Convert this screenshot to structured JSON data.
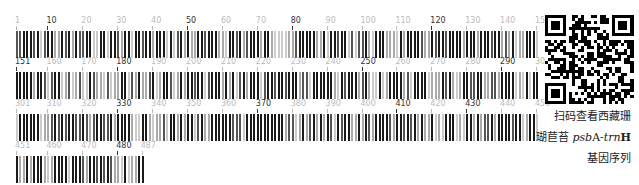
{
  "figure": {
    "rows": [
      {
        "start": 1,
        "end": 150,
        "labels": [
          {
            "text": "1",
            "pos": 1,
            "tone": "light"
          },
          {
            "text": "10",
            "pos": 10,
            "tone": "dark"
          },
          {
            "text": "20",
            "pos": 20,
            "tone": "light"
          },
          {
            "text": "30",
            "pos": 30,
            "tone": "light"
          },
          {
            "text": "40",
            "pos": 40,
            "tone": "light"
          },
          {
            "text": "50",
            "pos": 50,
            "tone": "dark"
          },
          {
            "text": "60",
            "pos": 60,
            "tone": "light"
          },
          {
            "text": "70",
            "pos": 70,
            "tone": "light"
          },
          {
            "text": "80",
            "pos": 80,
            "tone": "dark"
          },
          {
            "text": "90",
            "pos": 90,
            "tone": "light"
          },
          {
            "text": "100",
            "pos": 100,
            "tone": "light"
          },
          {
            "text": "110",
            "pos": 110,
            "tone": "light"
          },
          {
            "text": "120",
            "pos": 120,
            "tone": "dark"
          },
          {
            "text": "130",
            "pos": 130,
            "tone": "light"
          },
          {
            "text": "140",
            "pos": 140,
            "tone": "light"
          },
          {
            "text": "150",
            "pos": 150,
            "tone": "light"
          }
        ]
      },
      {
        "start": 151,
        "end": 300,
        "labels": [
          {
            "text": "151",
            "pos": 151,
            "tone": "dark"
          },
          {
            "text": "160",
            "pos": 160,
            "tone": "light"
          },
          {
            "text": "170",
            "pos": 170,
            "tone": "light"
          },
          {
            "text": "180",
            "pos": 180,
            "tone": "dark"
          },
          {
            "text": "190",
            "pos": 190,
            "tone": "light"
          },
          {
            "text": "200",
            "pos": 200,
            "tone": "light"
          },
          {
            "text": "210",
            "pos": 210,
            "tone": "light"
          },
          {
            "text": "220",
            "pos": 220,
            "tone": "light"
          },
          {
            "text": "230",
            "pos": 230,
            "tone": "light"
          },
          {
            "text": "240",
            "pos": 240,
            "tone": "light"
          },
          {
            "text": "250",
            "pos": 250,
            "tone": "dark"
          },
          {
            "text": "260",
            "pos": 260,
            "tone": "light"
          },
          {
            "text": "270",
            "pos": 270,
            "tone": "light"
          },
          {
            "text": "280",
            "pos": 280,
            "tone": "light"
          },
          {
            "text": "290",
            "pos": 290,
            "tone": "dark"
          },
          {
            "text": "300",
            "pos": 300,
            "tone": "light"
          }
        ]
      },
      {
        "start": 301,
        "end": 450,
        "labels": [
          {
            "text": "301",
            "pos": 301,
            "tone": "light"
          },
          {
            "text": "310",
            "pos": 310,
            "tone": "light"
          },
          {
            "text": "320",
            "pos": 320,
            "tone": "light"
          },
          {
            "text": "330",
            "pos": 330,
            "tone": "dark"
          },
          {
            "text": "340",
            "pos": 340,
            "tone": "light"
          },
          {
            "text": "350",
            "pos": 350,
            "tone": "light"
          },
          {
            "text": "360",
            "pos": 360,
            "tone": "light"
          },
          {
            "text": "370",
            "pos": 370,
            "tone": "dark"
          },
          {
            "text": "380",
            "pos": 380,
            "tone": "light"
          },
          {
            "text": "390",
            "pos": 390,
            "tone": "light"
          },
          {
            "text": "400",
            "pos": 400,
            "tone": "light"
          },
          {
            "text": "410",
            "pos": 410,
            "tone": "dark"
          },
          {
            "text": "420",
            "pos": 420,
            "tone": "light"
          },
          {
            "text": "430",
            "pos": 430,
            "tone": "dark"
          },
          {
            "text": "440",
            "pos": 440,
            "tone": "light"
          },
          {
            "text": "450",
            "pos": 450,
            "tone": "light"
          }
        ]
      },
      {
        "start": 451,
        "end": 487,
        "labels": [
          {
            "text": "451",
            "pos": 451,
            "tone": "light"
          },
          {
            "text": "460",
            "pos": 460,
            "tone": "light"
          },
          {
            "text": "470",
            "pos": 470,
            "tone": "light"
          },
          {
            "text": "480",
            "pos": 480,
            "tone": "dark"
          },
          {
            "text": "487",
            "pos": 487,
            "tone": "light"
          }
        ]
      }
    ],
    "total_length": 487,
    "colors": {
      "dark_bar": "#1a1a1a",
      "mid_bar": "#555555",
      "light_bar": "#aaaaaa",
      "pale_bar": "#cccccc"
    },
    "caption": {
      "line1": "扫码查看西藏珊",
      "line2_prefix": "瑚苣苔 ",
      "line2_italic1": "psb",
      "line2_mid": "A-",
      "line2_italic2": "trn",
      "line2_suffix": "H",
      "line3": "基因序列"
    },
    "qr_label": "qr-code"
  }
}
